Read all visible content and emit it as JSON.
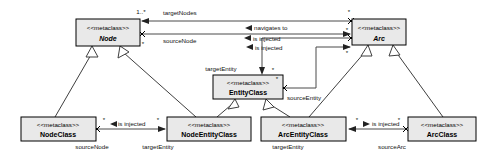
{
  "diagram": {
    "stereotype": "<<metaclass>>",
    "colors": {
      "box_fill": "#e9e9e9",
      "box_stroke": "#000000",
      "edge": "#4a4a4a",
      "background": "#ffffff"
    },
    "classes": [
      {
        "id": "node",
        "stereotype": "<<metaclass>>",
        "name": "Node",
        "abstract": true,
        "x": 76,
        "y": 19,
        "w": 64,
        "h": 27
      },
      {
        "id": "arc",
        "stereotype": "<<metaclass>>",
        "name": "Arc",
        "abstract": true,
        "x": 352,
        "y": 19,
        "w": 54,
        "h": 26
      },
      {
        "id": "entityclass",
        "stereotype": "<<metaclass>>",
        "name": "EntityClass",
        "abstract": false,
        "x": 213,
        "y": 75,
        "w": 70,
        "h": 24
      },
      {
        "id": "nodeclass",
        "stereotype": "<<metaclass>>",
        "name": "NodeClass",
        "abstract": false,
        "x": 21,
        "y": 117,
        "w": 75,
        "h": 24
      },
      {
        "id": "nodeentityclass",
        "stereotype": "<<metaclass>>",
        "name": "NodeEntityClass",
        "abstract": false,
        "x": 167,
        "y": 117,
        "w": 84,
        "h": 24
      },
      {
        "id": "arcentityclass",
        "stereotype": "<<metaclass>>",
        "name": "ArcEntityClass",
        "abstract": false,
        "x": 261,
        "y": 117,
        "w": 85,
        "h": 24
      },
      {
        "id": "arcclass",
        "stereotype": "<<metaclass>>",
        "name": "ArcClass",
        "abstract": false,
        "x": 408,
        "y": 117,
        "w": 68,
        "h": 24
      }
    ],
    "associations": [
      {
        "id": "a1",
        "from": "arc",
        "to": "node",
        "label": "",
        "source_role": "",
        "target_role": "targetNodes",
        "source_mult": "*",
        "target_mult": "1..*"
      },
      {
        "id": "a2",
        "from": "node",
        "to": "arc",
        "label": "navigates to",
        "source_role": "sourceNode",
        "target_role": "",
        "source_mult": "*",
        "target_mult": "*"
      },
      {
        "id": "a3",
        "from": "entity",
        "to": "arc",
        "label": "is injected",
        "source_role": "sourceEntity",
        "target_role": "",
        "source_mult": "*",
        "target_mult": "*"
      },
      {
        "id": "a4",
        "from": "arc",
        "to": "entityclass",
        "label": "is injected",
        "source_role": "",
        "target_role": "targetEntity",
        "source_mult": "*",
        "target_mult": "*"
      },
      {
        "id": "a5",
        "from": "nodeclass",
        "to": "nodeentityclass",
        "label": "is injected",
        "source_role": "sourceNode",
        "target_role": "targetEntity",
        "source_mult": "*",
        "target_mult": "*"
      },
      {
        "id": "a6",
        "from": "arcclass",
        "to": "arcentityclass",
        "label": "is injected",
        "source_role": "sourceArc",
        "target_role": "targetEntity",
        "source_mult": "*",
        "target_mult": "*"
      }
    ],
    "generalizations": [
      {
        "child": "nodeclass",
        "parent": "node"
      },
      {
        "child": "nodeentityclass",
        "parent": "node"
      },
      {
        "child": "nodeentityclass",
        "parent": "entityclass"
      },
      {
        "child": "arcentityclass",
        "parent": "entityclass"
      },
      {
        "child": "arcentityclass",
        "parent": "arc"
      },
      {
        "child": "arcclass",
        "parent": "arc"
      }
    ],
    "labels": {
      "targetNodes": "targetNodes",
      "sourceNode_top": "sourceNode",
      "navigates_to": "navigates to",
      "is_injected_1": "is injected",
      "is_injected_2": "is injected",
      "targetEntity_center": "targetEntity",
      "sourceEntity": "sourceEntity",
      "is_injected_left": "is injected",
      "is_injected_right": "is injected",
      "sourceNode_bottom": "sourceNode",
      "targetEntity_left": "targetEntity",
      "targetEntity_right": "targetEntity",
      "sourceArc": "sourceArc",
      "mult_one_star": "1..*",
      "mult_star": "*"
    }
  }
}
